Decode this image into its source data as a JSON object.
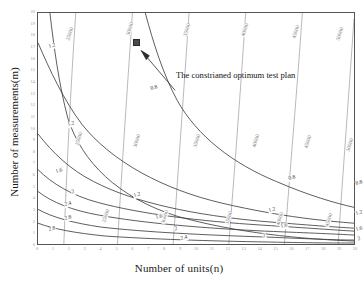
{
  "figure": {
    "xlabel": "Number of units(n)",
    "ylabel": "Number of measurements(m)",
    "annotation": "The constrianed optimum test plan"
  },
  "chart_data": {
    "type": "contour",
    "title": "",
    "xlabel": "Number of units(n)",
    "ylabel": "Number of measurements(m)",
    "xlim": [
      0,
      20
    ],
    "ylim": [
      0,
      20
    ],
    "grid": false,
    "legend": "none",
    "xticks": [
      0,
      1,
      2,
      3,
      4,
      5,
      6,
      7,
      8,
      9,
      10,
      11,
      12,
      13,
      14,
      15,
      16,
      17,
      18,
      19,
      20
    ],
    "yticks": [
      0,
      1,
      2,
      3,
      4,
      5,
      6,
      7,
      8,
      9,
      10,
      11,
      12,
      13,
      14,
      15,
      16,
      17,
      18,
      19,
      20
    ],
    "series": [
      {
        "name": "cost",
        "kind": "cost-contours",
        "color": "#8c8c8c",
        "levels": [
          25000,
          30000,
          35000,
          40000,
          45000,
          50000
        ],
        "level_labels": [
          "25000",
          "30000",
          "35000",
          "40000",
          "45000",
          "50000"
        ],
        "description": "Near-vertical budget contours rising left to right"
      },
      {
        "name": "criterion",
        "kind": "variance-contours",
        "color": "#3f3f3f",
        "levels": [
          0.8,
          1.2,
          1.6,
          2,
          2.4,
          2.8
        ],
        "level_labels": [
          "0.8",
          "1.2",
          "1.6",
          "2",
          "2.4",
          "2.8"
        ],
        "description": "Hyperbolic asymptotic contours decreasing toward upper right"
      }
    ],
    "marker_points": [
      {
        "label": "The constrianed optimum test plan",
        "x": 6,
        "y": 18,
        "marker": "square",
        "color": "#4a4a4a"
      }
    ],
    "cost_labels": [
      {
        "text": "25000",
        "x": 2.0,
        "y": 18.2
      },
      {
        "text": "30000",
        "x": 5.8,
        "y": 18.6
      },
      {
        "text": "35000",
        "x": 9.4,
        "y": 18.5
      },
      {
        "text": "40000",
        "x": 13.0,
        "y": 18.5
      },
      {
        "text": "45000",
        "x": 16.2,
        "y": 18.4
      },
      {
        "text": "50000",
        "x": 19.0,
        "y": 18.2
      },
      {
        "text": "25000",
        "x": 2.6,
        "y": 9.2
      },
      {
        "text": "30000",
        "x": 6.2,
        "y": 9.0
      },
      {
        "text": "35000",
        "x": 10.0,
        "y": 9.0
      },
      {
        "text": "40000",
        "x": 13.7,
        "y": 9.0
      },
      {
        "text": "45000",
        "x": 17.0,
        "y": 8.9
      },
      {
        "text": "50000",
        "x": 19.6,
        "y": 8.7
      },
      {
        "text": "25000",
        "x": 4.3,
        "y": 2.6
      },
      {
        "text": "30000",
        "x": 8.0,
        "y": 2.5
      },
      {
        "text": "35000",
        "x": 12.0,
        "y": 2.4
      },
      {
        "text": "40000",
        "x": 15.2,
        "y": 2.3
      },
      {
        "text": "45000",
        "x": 18.3,
        "y": 2.2
      }
    ],
    "criterion_labels": [
      {
        "text": "1.2",
        "x": 0.9,
        "y": 17.2
      },
      {
        "text": "1.2",
        "x": 2.1,
        "y": 10.5
      },
      {
        "text": "0.8",
        "x": 7.3,
        "y": 13.6
      },
      {
        "text": "0.8",
        "x": 16.0,
        "y": 5.8
      },
      {
        "text": "0.8",
        "x": 20.2,
        "y": 5.4
      },
      {
        "text": "1.6",
        "x": 1.3,
        "y": 6.4
      },
      {
        "text": "1.2",
        "x": 6.2,
        "y": 4.4
      },
      {
        "text": "1.2",
        "x": 14.7,
        "y": 3.1
      },
      {
        "text": "1.2",
        "x": 20.2,
        "y": 2.8
      },
      {
        "text": "1.6",
        "x": 7.6,
        "y": 2.5
      },
      {
        "text": "1.6",
        "x": 15.5,
        "y": 1.7
      },
      {
        "text": "1.6",
        "x": 20.2,
        "y": 1.5
      },
      {
        "text": "2",
        "x": 2.2,
        "y": 4.6
      },
      {
        "text": "2",
        "x": 8.7,
        "y": 1.5
      },
      {
        "text": "2",
        "x": 14.2,
        "y": 0.9
      },
      {
        "text": "2",
        "x": 20.2,
        "y": 0.6
      },
      {
        "text": "2.4",
        "x": 1.9,
        "y": 3.6
      },
      {
        "text": "2.4",
        "x": 9.2,
        "y": 0.7
      },
      {
        "text": "2.8",
        "x": 1.9,
        "y": 2.4
      },
      {
        "text": "2.8",
        "x": 0.9,
        "y": 1.5
      }
    ]
  }
}
